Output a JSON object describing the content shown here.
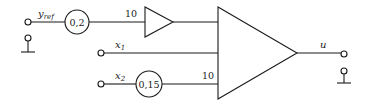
{
  "diagram": {
    "inputs": {
      "y_ref": {
        "symbol": "y",
        "subscript": "ref"
      },
      "x1": {
        "symbol": "x",
        "subscript": "1"
      },
      "x2": {
        "symbol": "x",
        "subscript": "2"
      }
    },
    "blocks": {
      "scaler_yref": {
        "value": "0,2"
      },
      "scaler_x2": {
        "value": "0,15"
      },
      "amp_small_input_gain": "10",
      "summer_x2_input_gain": "10"
    },
    "output": {
      "symbol": "u"
    },
    "colors": {
      "stroke": "#1a1a1a",
      "background": "#ffffff"
    }
  }
}
